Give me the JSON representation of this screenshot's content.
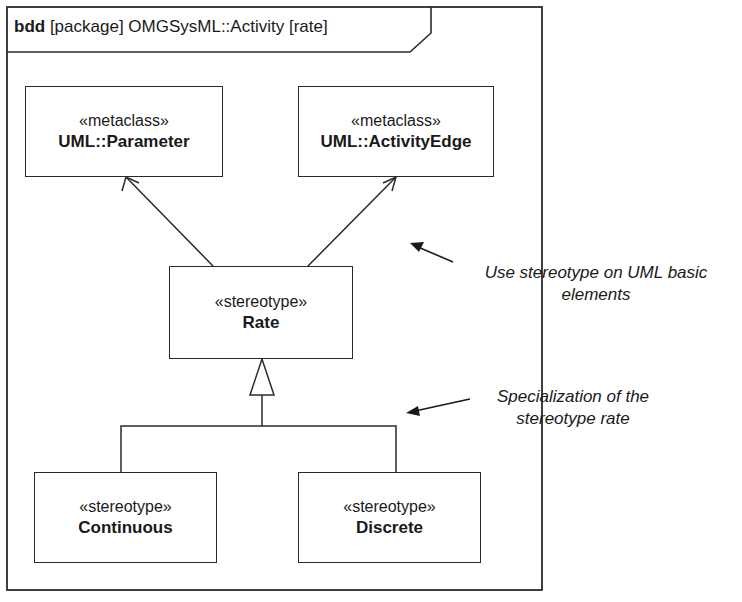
{
  "frame": {
    "kind": "bdd",
    "title": "[package] OMGSysML::Activity [rate]"
  },
  "blocks": [
    {
      "id": "parameter",
      "stereotype": "«metaclass»",
      "name": "UML::Parameter"
    },
    {
      "id": "activity_edge",
      "stereotype": "«metaclass»",
      "name": "UML::ActivityEdge"
    },
    {
      "id": "rate",
      "stereotype": "«stereotype»",
      "name": "Rate"
    },
    {
      "id": "continuous",
      "stereotype": "«stereotype»",
      "name": "Continuous"
    },
    {
      "id": "discrete",
      "stereotype": "«stereotype»",
      "name": "Discrete"
    }
  ],
  "relationships": [
    {
      "type": "extension",
      "from": "rate",
      "to": "parameter"
    },
    {
      "type": "extension",
      "from": "rate",
      "to": "activity_edge"
    },
    {
      "type": "generalization",
      "from": "continuous",
      "to": "rate"
    },
    {
      "type": "generalization",
      "from": "discrete",
      "to": "rate"
    }
  ],
  "annotations": [
    {
      "line1": "Use stereotype on UML basic",
      "line2": "elements"
    },
    {
      "line1": "Specialization of the",
      "line2": "stereotype rate"
    }
  ],
  "colors": {
    "stroke": "#2a2a2a",
    "background": "#ffffff"
  }
}
